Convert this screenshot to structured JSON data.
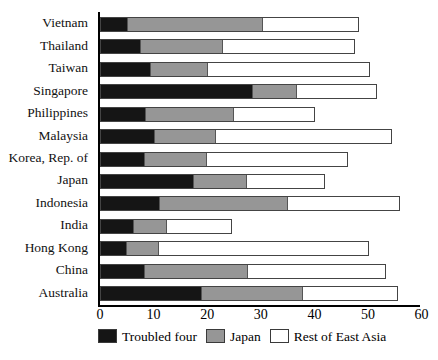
{
  "chart_data": {
    "type": "bar",
    "orientation": "horizontal",
    "stacked": true,
    "title": "",
    "subtitle": "",
    "xlabel": "",
    "ylabel": "",
    "xlim": [
      0,
      60
    ],
    "ylim": null,
    "grid": false,
    "legend_position": "bottom",
    "xticks": [
      0,
      10,
      20,
      30,
      40,
      50,
      60
    ],
    "xtick_labels": [
      "0",
      "10",
      "20",
      "30",
      "40",
      "50",
      "60"
    ],
    "categories": [
      "Vietnam",
      "Thailand",
      "Taiwan",
      "Singapore",
      "Philippines",
      "Malaysia",
      "Korea, Rep. of",
      "Japan",
      "Indonesia",
      "India",
      "Hong Kong",
      "China",
      "Australia"
    ],
    "series": [
      {
        "name": "Troubled four",
        "color": "#151515",
        "values": [
          4.9,
          7.2,
          9.1,
          28.2,
          8.3,
          9.8,
          8.1,
          17.1,
          10.9,
          5.9,
          4.7,
          8.1,
          18.6
        ]
      },
      {
        "name": "Japan",
        "color": "#969696",
        "values": [
          25.3,
          15.6,
          10.8,
          8.4,
          16.5,
          11.7,
          11.6,
          10.2,
          24.0,
          6.5,
          6.2,
          19.4,
          19.0
        ]
      },
      {
        "name": "Rest of East Asia",
        "color": "#ffffff",
        "values": [
          18.1,
          24.8,
          30.4,
          15.0,
          15.4,
          33.0,
          26.5,
          14.6,
          21.1,
          12.2,
          39.2,
          25.9,
          18.0
        ]
      }
    ],
    "totals": [
      48.3,
      47.6,
      50.3,
      51.6,
      40.2,
      54.5,
      46.2,
      41.9,
      56.0,
      24.6,
      50.1,
      53.4,
      55.6
    ],
    "cumulative_boundaries": [
      [
        4.9,
        30.2,
        48.3
      ],
      [
        7.2,
        22.8,
        47.6
      ],
      [
        9.1,
        19.9,
        50.3
      ],
      [
        28.2,
        36.6,
        51.6
      ],
      [
        8.3,
        24.8,
        40.2
      ],
      [
        9.8,
        21.5,
        54.5
      ],
      [
        8.1,
        19.7,
        46.2
      ],
      [
        17.1,
        27.3,
        41.9
      ],
      [
        10.9,
        34.9,
        56.0
      ],
      [
        5.9,
        12.4,
        24.6
      ],
      [
        4.7,
        10.9,
        50.1
      ],
      [
        8.1,
        27.5,
        53.4
      ],
      [
        18.6,
        37.6,
        55.6
      ]
    ]
  },
  "legend": {
    "items": [
      {
        "label": "Troubled four",
        "swatch": "troubled-swatch"
      },
      {
        "label": "Japan",
        "swatch": "japan-swatch"
      },
      {
        "label": "Rest of East Asia",
        "swatch": "rest-swatch"
      }
    ]
  }
}
